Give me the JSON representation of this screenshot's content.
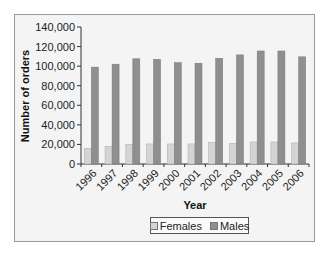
{
  "chart_data": {
    "type": "bar",
    "title": "",
    "xlabel": "Year",
    "ylabel": "Number of orders",
    "ylim": [
      0,
      140000
    ],
    "yticks": [
      0,
      20000,
      40000,
      60000,
      80000,
      100000,
      120000,
      140000
    ],
    "ytick_labels": [
      "0",
      "20,000",
      "40,000",
      "60,000",
      "80,000",
      "100,000",
      "120,000",
      "140,000"
    ],
    "categories": [
      "1996",
      "1997",
      "1998",
      "1999",
      "2000",
      "2001",
      "2002",
      "2003",
      "2004",
      "2005",
      "2006"
    ],
    "series": [
      {
        "name": "Females",
        "color": "#d4d4d4",
        "values": [
          16000,
          18000,
          20000,
          20500,
          20500,
          20500,
          22000,
          21000,
          22500,
          22500,
          21500
        ]
      },
      {
        "name": "Males",
        "color": "#8f8f8f",
        "values": [
          99000,
          102000,
          107500,
          107000,
          103500,
          103000,
          108000,
          111500,
          115500,
          115500,
          109500
        ]
      }
    ],
    "grid": false,
    "legend_position": "bottom"
  },
  "legend": {
    "items": [
      {
        "label": "Females",
        "color": "#d4d4d4"
      },
      {
        "label": "Males",
        "color": "#8f8f8f"
      }
    ]
  }
}
